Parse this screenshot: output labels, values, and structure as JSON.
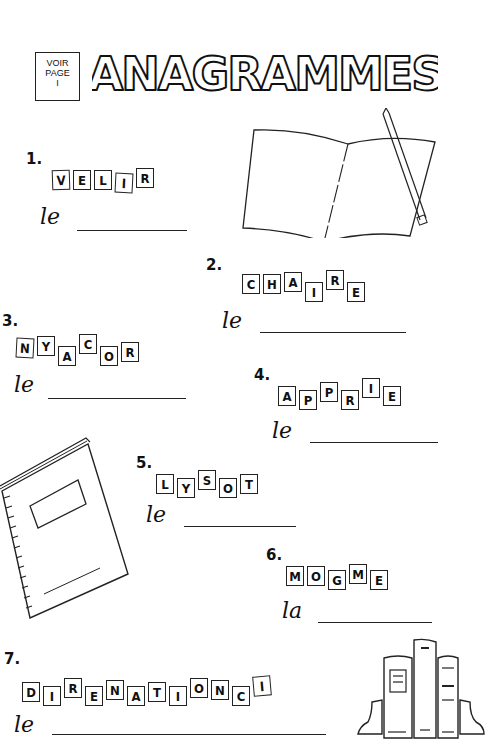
{
  "header": {
    "see_page": [
      "VOIR",
      "PAGE",
      "I"
    ],
    "title": "ANAGRAMMES"
  },
  "exercises": [
    {
      "number": "1.",
      "letters": [
        "V",
        "E",
        "L",
        "I",
        "R"
      ],
      "article": "le"
    },
    {
      "number": "2.",
      "letters": [
        "C",
        "H",
        "A",
        "I",
        "R",
        "E"
      ],
      "article": "le"
    },
    {
      "number": "3.",
      "letters": [
        "N",
        "Y",
        "A",
        "C",
        "O",
        "R"
      ],
      "article": "le"
    },
    {
      "number": "4.",
      "letters": [
        "A",
        "P",
        "P",
        "R",
        "I",
        "E"
      ],
      "article": "le"
    },
    {
      "number": "5.",
      "letters": [
        "L",
        "Y",
        "S",
        "O",
        "T"
      ],
      "article": "le"
    },
    {
      "number": "6.",
      "letters": [
        "M",
        "O",
        "G",
        "M",
        "E"
      ],
      "article": "la"
    },
    {
      "number": "7.",
      "letters": [
        "D",
        "I",
        "R",
        "E",
        "N",
        "A",
        "T",
        "I",
        "O",
        "N",
        "C",
        "I"
      ],
      "article": "le"
    }
  ],
  "illustrations": [
    "open-book-with-pencil",
    "spiral-notebook",
    "books-with-bookends"
  ]
}
